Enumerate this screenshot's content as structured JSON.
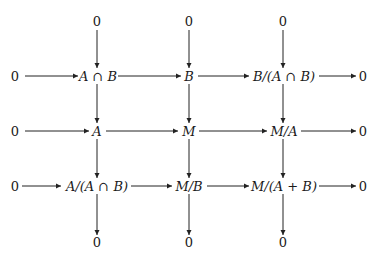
{
  "diagram": {
    "type": "commutative-diagram",
    "top_zeros": [
      "0",
      "0",
      "0"
    ],
    "bottom_zeros": [
      "0",
      "0",
      "0"
    ],
    "rows": [
      {
        "left": "0",
        "nodes": [
          "A ∩ B",
          "B",
          "B/(A ∩ B)"
        ],
        "right": "0"
      },
      {
        "left": "0",
        "nodes": [
          "A",
          "M",
          "M/A"
        ],
        "right": "0"
      },
      {
        "left": "0",
        "nodes": [
          "A/(A ∩ B)",
          "M/B",
          "M/(A + B)"
        ],
        "right": "0"
      }
    ],
    "edges": [
      {
        "from": "0",
        "to": "A ∩ B"
      },
      {
        "from": "A ∩ B",
        "to": "B"
      },
      {
        "from": "B",
        "to": "B/(A ∩ B)"
      },
      {
        "from": "B/(A ∩ B)",
        "to": "0"
      },
      {
        "from": "0",
        "to": "A"
      },
      {
        "from": "A",
        "to": "M"
      },
      {
        "from": "M",
        "to": "M/A"
      },
      {
        "from": "M/A",
        "to": "0"
      },
      {
        "from": "0",
        "to": "A/(A ∩ B)"
      },
      {
        "from": "A/(A ∩ B)",
        "to": "M/B"
      },
      {
        "from": "M/B",
        "to": "M/(A + B)"
      },
      {
        "from": "M/(A + B)",
        "to": "0"
      },
      {
        "from": "0",
        "to": "A ∩ B",
        "direction": "down"
      },
      {
        "from": "A ∩ B",
        "to": "A",
        "direction": "down"
      },
      {
        "from": "A",
        "to": "A/(A ∩ B)",
        "direction": "down"
      },
      {
        "from": "A/(A ∩ B)",
        "to": "0",
        "direction": "down"
      },
      {
        "from": "0",
        "to": "B",
        "direction": "down"
      },
      {
        "from": "B",
        "to": "M",
        "direction": "down"
      },
      {
        "from": "M",
        "to": "M/B",
        "direction": "down"
      },
      {
        "from": "M/B",
        "to": "0",
        "direction": "down"
      },
      {
        "from": "0",
        "to": "B/(A ∩ B)",
        "direction": "down"
      },
      {
        "from": "B/(A ∩ B)",
        "to": "M/A",
        "direction": "down"
      },
      {
        "from": "M/A",
        "to": "M/(A + B)",
        "direction": "down"
      },
      {
        "from": "M/(A + B)",
        "to": "0",
        "direction": "down"
      }
    ],
    "stroke_color": "#222222",
    "text_color": "#1a1a1a"
  }
}
